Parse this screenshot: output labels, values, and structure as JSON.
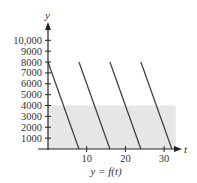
{
  "chart_data": {
    "type": "line",
    "title": "",
    "caption": "y = f(t)",
    "xlabel": "t",
    "ylabel": "y",
    "xlim": [
      0,
      33
    ],
    "ylim": [
      0,
      10000
    ],
    "x_ticks": [
      10,
      20,
      30
    ],
    "x_tick_labels": [
      "10",
      "20",
      "30"
    ],
    "y_ticks": [
      1000,
      2000,
      3000,
      4000,
      5000,
      6000,
      7000,
      8000,
      9000,
      10000
    ],
    "y_tick_labels": [
      "1000",
      "2000",
      "3000",
      "4000",
      "5000",
      "6000",
      "7000",
      "8000",
      "9000",
      "10,000"
    ],
    "grid": false,
    "shaded_region": {
      "t_range": [
        0,
        33
      ],
      "y_range": [
        0,
        4000
      ],
      "color": "#e6e6e6"
    },
    "series": [
      {
        "name": "segment 1",
        "x": [
          0,
          8
        ],
        "values": [
          8000,
          0
        ]
      },
      {
        "name": "segment 2",
        "x": [
          8,
          16
        ],
        "values": [
          8000,
          0
        ]
      },
      {
        "name": "segment 3",
        "x": [
          16,
          24
        ],
        "values": [
          8000,
          0
        ]
      },
      {
        "name": "segment 4",
        "x": [
          24,
          32
        ],
        "values": [
          8000,
          0
        ]
      }
    ],
    "line_color": "#444444"
  },
  "labels": {
    "y_axis": "y",
    "t_axis": "t",
    "caption": "y = f(t)"
  }
}
